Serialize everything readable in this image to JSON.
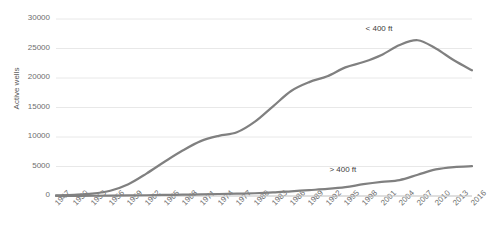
{
  "chart_data": {
    "type": "line",
    "title": "",
    "xlabel": "",
    "ylabel": "Active wells",
    "ylim": [
      0,
      30000
    ],
    "yticks": [
      0,
      5000,
      10000,
      15000,
      20000,
      25000,
      30000
    ],
    "ytick_labels": [
      "0",
      "5000",
      "10000",
      "15000",
      "20000",
      "25000",
      "30000"
    ],
    "grid": true,
    "legend_position": "inline-annotation",
    "line_color": "#808080",
    "categories": [
      1947,
      1950,
      1953,
      1956,
      1959,
      1962,
      1965,
      1968,
      1971,
      1974,
      1977,
      1980,
      1983,
      1986,
      1989,
      1992,
      1995,
      1998,
      2001,
      2004,
      2007,
      2010,
      2013,
      2016
    ],
    "tick_labels": [
      "1947",
      "1950",
      "1953",
      "1956",
      "1959",
      "1962",
      "1965",
      "1968",
      "1971",
      "1974",
      "1977",
      "1980",
      "1983",
      "1986",
      "1989",
      "1992",
      "1995",
      "1998",
      "2001",
      "2004",
      "2007",
      "2010",
      "2013",
      "2016"
    ],
    "series": [
      {
        "name": "< 400 ft",
        "label": "< 400 ft",
        "color": "#808080",
        "values": [
          100,
          200,
          400,
          900,
          2000,
          3800,
          5800,
          7700,
          9300,
          10200,
          10800,
          12600,
          15200,
          17800,
          19300,
          20300,
          21800,
          22700,
          23900,
          25600,
          26400,
          25000,
          23000,
          21300
        ]
      },
      {
        "name": "> 400 ft",
        "label": "> 400 ft",
        "color": "#808080",
        "values": [
          20,
          30,
          40,
          60,
          90,
          130,
          180,
          230,
          280,
          340,
          400,
          470,
          600,
          800,
          1000,
          1200,
          1500,
          2000,
          2400,
          2700,
          3600,
          4500,
          4900,
          5050
        ]
      }
    ],
    "annotations": [
      {
        "text": "< 400 ft",
        "x": 2001,
        "y": 28200
      },
      {
        "text": "> 400 ft",
        "x": 1995,
        "y": 4200
      }
    ]
  }
}
